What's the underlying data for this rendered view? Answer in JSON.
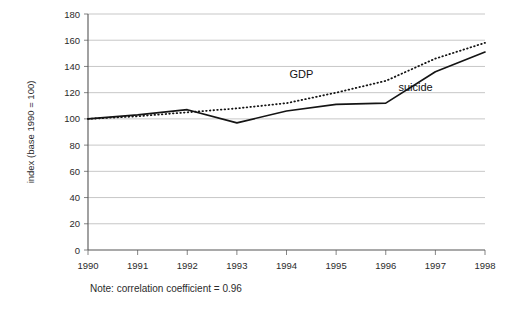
{
  "chart_data": {
    "type": "line",
    "title": "",
    "xlabel": "",
    "ylabel": "index (base 1990 = 100)",
    "categories": [
      "1990",
      "1991",
      "1992",
      "1993",
      "1994",
      "1995",
      "1996",
      "1997",
      "1998"
    ],
    "x": [
      1990,
      1991,
      1992,
      1993,
      1994,
      1995,
      1996,
      1997,
      1998
    ],
    "xlim": [
      1990,
      1998
    ],
    "ylim": [
      0,
      180
    ],
    "yticks": [
      0,
      20,
      40,
      60,
      80,
      100,
      120,
      140,
      160,
      180
    ],
    "ytick_labels": [
      "0",
      "20",
      "40",
      "60",
      "80",
      "100",
      "120",
      "140",
      "160",
      "180"
    ],
    "grid": true,
    "legend_position": "inline-annotation",
    "series": [
      {
        "name": "suicide",
        "style": "solid",
        "color": "#141414",
        "values": [
          100,
          103,
          107,
          97,
          106,
          111,
          112,
          136,
          151
        ]
      },
      {
        "name": "GDP",
        "style": "dotted",
        "color": "#141414",
        "values": [
          100,
          102,
          105,
          108,
          112,
          120,
          129,
          146,
          158
        ]
      }
    ],
    "annotations": [
      {
        "text": "GDP",
        "x": 1994.3,
        "y": 131
      },
      {
        "text": "suicide",
        "x": 1996.6,
        "y": 121
      }
    ],
    "note": "Note: correlation coefficient = 0.96"
  },
  "figure": {
    "note_label": "Note: correlation coefficient = 0.96",
    "y_axis_title": "index (base 1990 = 100)"
  }
}
